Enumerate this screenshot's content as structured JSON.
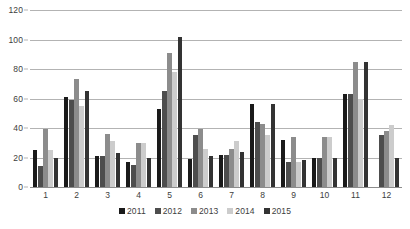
{
  "chart_data": {
    "type": "bar",
    "title": "",
    "subtitle": "",
    "xlabel": "",
    "ylabel": "",
    "categories": [
      "1",
      "2",
      "3",
      "4",
      "5",
      "6",
      "7",
      "8",
      "9",
      "10",
      "11",
      "12"
    ],
    "ylim": [
      0,
      120
    ],
    "yticks": [
      0,
      20,
      40,
      60,
      80,
      100,
      120
    ],
    "ytick_labels": [
      "0",
      "20",
      "40",
      "60",
      "80",
      "100",
      "120"
    ],
    "grid": "horizontal",
    "legend_position": "bottom-center",
    "series": [
      {
        "name": "2011",
        "color": "#1a1a1a",
        "values": [
          25,
          61,
          21,
          17,
          53,
          19,
          22,
          56,
          32,
          20,
          63,
          0
        ]
      },
      {
        "name": "2012",
        "color": "#4d4d4d",
        "values": [
          14,
          59,
          21,
          15,
          65,
          35,
          22,
          44,
          17,
          20,
          63,
          35
        ]
      },
      {
        "name": "2013",
        "color": "#8c8c8c",
        "values": [
          39,
          73,
          36,
          30,
          91,
          39,
          26,
          43,
          34,
          34,
          85,
          38
        ]
      },
      {
        "name": "2014",
        "color": "#cccccc",
        "values": [
          25,
          55,
          31,
          30,
          78,
          26,
          31,
          35,
          17,
          34,
          60,
          42
        ]
      },
      {
        "name": "2015",
        "color": "#333333",
        "values": [
          20,
          65,
          23,
          20,
          102,
          21,
          24,
          56,
          18,
          20,
          85,
          20
        ]
      }
    ]
  },
  "colors": {
    "gridline": "#b3b3b3",
    "baseline": "#8c8c8c",
    "text": "#3d3d3d",
    "background": "#ffffff"
  }
}
